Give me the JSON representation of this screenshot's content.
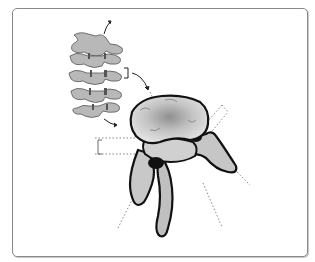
{
  "figure": {
    "panels": [
      {
        "name": "spine-column",
        "description": "Five stacked vertebrae, side view, grey shaded"
      },
      {
        "name": "vertebra-detail",
        "description": "Enlarged single vertebra (oblique view) with body, pedicles, transverse and spinous processes"
      }
    ],
    "annotations": {
      "bracket_count": 3,
      "dotted_guide_lines": 6,
      "arrows": 3
    },
    "colors": {
      "bone_fill": "#b5b5b5",
      "bone_light": "#dcdcdc",
      "outline": "#1a1a1a",
      "frame": "#8a8a8a",
      "background": "#ffffff"
    }
  }
}
